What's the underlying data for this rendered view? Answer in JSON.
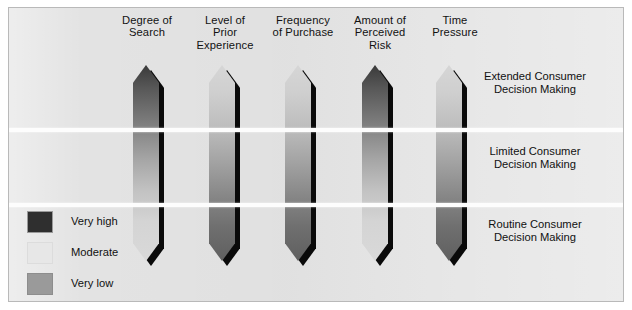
{
  "figure": {
    "type": "diagram",
    "background_color": "#e3e3e3",
    "frame_border_color": "#b9b9b9"
  },
  "columns": [
    {
      "id": "degree-of-search",
      "label": "Degree of\nSearch",
      "x": 84,
      "arrow_x": 124,
      "gradient": "dark-to-light",
      "top_level": "Very high",
      "bottom_level": "Very low"
    },
    {
      "id": "level-of-prior-experience",
      "label": "Level of\nPrior\nExperience",
      "x": 162,
      "arrow_x": 200,
      "gradient": "light-to-dark",
      "top_level": "Very low",
      "bottom_level": "Very high"
    },
    {
      "id": "frequency-of-purchase",
      "label": "Frequency\nof Purchase",
      "x": 240,
      "arrow_x": 276,
      "gradient": "light-to-dark",
      "top_level": "Very low",
      "bottom_level": "Very high"
    },
    {
      "id": "amount-of-perceived-risk",
      "label": "Amount of\nPerceived\nRisk",
      "x": 317,
      "arrow_x": 353,
      "gradient": "dark-to-light",
      "top_level": "Very high",
      "bottom_level": "Very low"
    },
    {
      "id": "time-pressure",
      "label": "Time\nPressure",
      "x": 392,
      "arrow_x": 427,
      "gradient": "light-to-dark",
      "top_level": "Very low",
      "bottom_level": "Very high"
    }
  ],
  "bands": [
    {
      "id": "extended",
      "label": "Extended Consumer\nDecision Making",
      "top": 62
    },
    {
      "id": "limited",
      "label": "Limited Consumer\nDecision Making",
      "top": 137
    },
    {
      "id": "routine",
      "label": "Routine Consumer\nDecision Making",
      "top": 210
    }
  ],
  "dividers": [
    {
      "id": "divider-extended-limited",
      "top": 120
    },
    {
      "id": "divider-limited-routine",
      "top": 195
    }
  ],
  "legend": {
    "items": [
      {
        "id": "very-high",
        "label": "Very high",
        "color": "#2f2f2f"
      },
      {
        "id": "moderate",
        "label": "Moderate",
        "color": "#e7e7e7"
      },
      {
        "id": "very-low",
        "label": "Very low",
        "color": "#9a9a9a"
      }
    ]
  }
}
